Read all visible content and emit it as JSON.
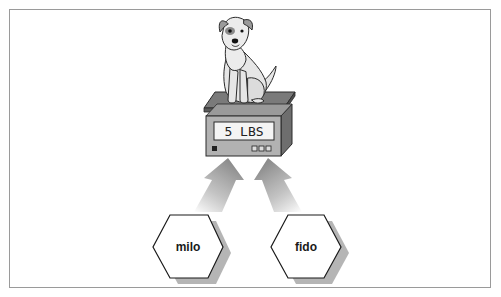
{
  "diagram": {
    "scale": {
      "display_reading": "5 LBS",
      "subject": "dog"
    },
    "nodes": [
      {
        "id": "milo",
        "label": "milo",
        "shape": "hexagon"
      },
      {
        "id": "fido",
        "label": "fido",
        "shape": "hexagon"
      }
    ],
    "edges": [
      {
        "from": "milo",
        "to": "scale"
      },
      {
        "from": "fido",
        "to": "scale"
      }
    ],
    "colors": {
      "frame_border": "#9a9a9a",
      "arrow_fill": "#8c8c8c",
      "shadow": "#b5b5b5",
      "scale_body": "#a9a9a9",
      "scale_dark": "#6e6e6e",
      "lcd_bg": "#f4f4f4",
      "dog_fill": "#e6e6e6",
      "outline": "#2a2a2a"
    }
  }
}
